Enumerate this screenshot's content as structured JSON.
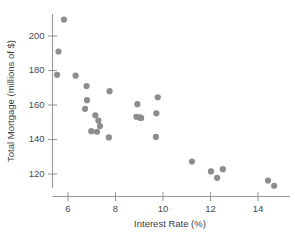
{
  "chart_data": {
    "type": "scatter",
    "title": "",
    "subtitle": "",
    "xlabel": "Interest Rate (%)",
    "ylabel": "Total Mortgage (millions of $)",
    "xlim": [
      5.2,
      15.0
    ],
    "ylim": [
      111,
      213
    ],
    "xticks": [
      6,
      8,
      10,
      12,
      14
    ],
    "yticks": [
      120,
      140,
      160,
      180,
      200
    ],
    "xtick_labels": [
      "6",
      "8",
      "10",
      "12",
      "14"
    ],
    "ytick_labels": [
      "120",
      "140",
      "160",
      "180",
      "200"
    ],
    "grid": false,
    "legend": null,
    "legend_position": "none",
    "marker": "circle",
    "marker_color": "#8d8d8d",
    "marker_size": 3.1,
    "points": [
      {
        "x": 5.83,
        "y": 209.5
      },
      {
        "x": 5.6,
        "y": 191.0
      },
      {
        "x": 5.54,
        "y": 177.5
      },
      {
        "x": 6.32,
        "y": 177.0
      },
      {
        "x": 6.78,
        "y": 171.0
      },
      {
        "x": 6.8,
        "y": 162.8
      },
      {
        "x": 6.72,
        "y": 157.8
      },
      {
        "x": 7.15,
        "y": 154.0
      },
      {
        "x": 7.28,
        "y": 151.0
      },
      {
        "x": 7.75,
        "y": 168.0
      },
      {
        "x": 6.98,
        "y": 144.8
      },
      {
        "x": 7.22,
        "y": 144.5
      },
      {
        "x": 7.35,
        "y": 147.8
      },
      {
        "x": 7.72,
        "y": 141.2
      },
      {
        "x": 8.92,
        "y": 160.5
      },
      {
        "x": 8.88,
        "y": 153.2
      },
      {
        "x": 9.02,
        "y": 152.8
      },
      {
        "x": 9.08,
        "y": 152.5
      },
      {
        "x": 9.78,
        "y": 164.5
      },
      {
        "x": 9.72,
        "y": 155.2
      },
      {
        "x": 9.7,
        "y": 141.5
      },
      {
        "x": 11.22,
        "y": 127.2
      },
      {
        "x": 12.02,
        "y": 121.5
      },
      {
        "x": 12.28,
        "y": 117.8
      },
      {
        "x": 12.52,
        "y": 122.8
      },
      {
        "x": 14.42,
        "y": 116.2
      },
      {
        "x": 14.68,
        "y": 113.2
      }
    ]
  },
  "axes": {
    "x_axis_label": "Interest Rate (%)",
    "y_axis_label": "Total Mortgage (millions of $)"
  }
}
